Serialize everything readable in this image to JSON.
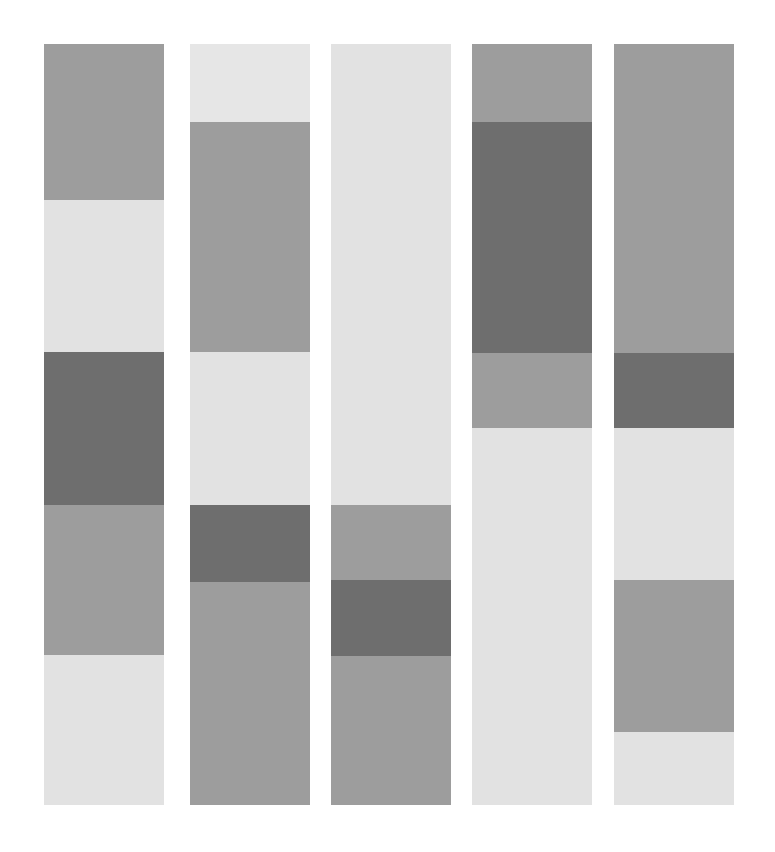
{
  "figure": {
    "title": "",
    "background_color": "#ffffff",
    "width": 775,
    "height": 852
  },
  "palette": {
    "very_light": "#e2e2e2",
    "light": "#dedede",
    "light_alt": "#e0e0e0",
    "medium_light": "#aaaaaa",
    "medium": "#9d9d9d",
    "medium_dark": "#969696",
    "dark": "#6e6e6e",
    "dark_alt": "#6a6a6a"
  },
  "chart_data": {
    "type": "bar",
    "title": "",
    "subtitle": "",
    "xlabel": "",
    "ylabel": "",
    "orientation": "vertical-stacked",
    "categories": [
      "Column 1",
      "Column 2",
      "Column 3",
      "Column 4",
      "Column 5"
    ],
    "grid": false,
    "legend": "none",
    "axis_labels_visible": false,
    "tick_labels_visible": false,
    "ylim": [
      44,
      805
    ],
    "columns": [
      {
        "name": "Column 1",
        "x": 44,
        "width": 120,
        "top": 44,
        "bottom": 805,
        "segments": [
          {
            "label": "c1-s1",
            "color": "#9d9d9d",
            "tone": "medium",
            "y_start": 44,
            "y_end": 200,
            "height": 156
          },
          {
            "label": "c1-s2",
            "color": "#e2e2e2",
            "tone": "very_light",
            "y_start": 200,
            "y_end": 352,
            "height": 152
          },
          {
            "label": "c1-s3",
            "color": "#6e6e6e",
            "tone": "dark",
            "y_start": 352,
            "y_end": 505,
            "height": 153
          },
          {
            "label": "c1-s4",
            "color": "#9d9d9d",
            "tone": "medium",
            "y_start": 505,
            "y_end": 655,
            "height": 150
          },
          {
            "label": "c1-s5",
            "color": "#e2e2e2",
            "tone": "very_light",
            "y_start": 655,
            "y_end": 805,
            "height": 150
          }
        ]
      },
      {
        "name": "Column 2",
        "x": 190,
        "width": 120,
        "top": 44,
        "bottom": 805,
        "segments": [
          {
            "label": "c2-s1",
            "color": "#e6e6e6",
            "tone": "very_light",
            "y_start": 44,
            "y_end": 122,
            "height": 78
          },
          {
            "label": "c2-s2",
            "color": "#9d9d9d",
            "tone": "medium",
            "y_start": 122,
            "y_end": 352,
            "height": 230
          },
          {
            "label": "c2-s3",
            "color": "#e2e2e2",
            "tone": "very_light",
            "y_start": 352,
            "y_end": 505,
            "height": 153
          },
          {
            "label": "c2-s4",
            "color": "#6e6e6e",
            "tone": "dark",
            "y_start": 505,
            "y_end": 582,
            "height": 77
          },
          {
            "label": "c2-s5",
            "color": "#9d9d9d",
            "tone": "medium",
            "y_start": 582,
            "y_end": 805,
            "height": 223
          }
        ]
      },
      {
        "name": "Column 3",
        "x": 331,
        "width": 120,
        "top": 44,
        "bottom": 805,
        "segments": [
          {
            "label": "c3-s1",
            "color": "#e2e2e2",
            "tone": "very_light",
            "y_start": 44,
            "y_end": 505,
            "height": 461
          },
          {
            "label": "c3-s2",
            "color": "#9d9d9d",
            "tone": "medium",
            "y_start": 505,
            "y_end": 580,
            "height": 75
          },
          {
            "label": "c3-s3",
            "color": "#6e6e6e",
            "tone": "dark",
            "y_start": 580,
            "y_end": 656,
            "height": 76
          },
          {
            "label": "c3-s4",
            "color": "#9d9d9d",
            "tone": "medium",
            "y_start": 656,
            "y_end": 805,
            "height": 149
          }
        ]
      },
      {
        "name": "Column 4",
        "x": 472,
        "width": 120,
        "top": 44,
        "bottom": 805,
        "segments": [
          {
            "label": "c4-s1",
            "color": "#9d9d9d",
            "tone": "medium",
            "y_start": 44,
            "y_end": 122,
            "height": 78
          },
          {
            "label": "c4-s2",
            "color": "#6e6e6e",
            "tone": "dark",
            "y_start": 122,
            "y_end": 353,
            "height": 231
          },
          {
            "label": "c4-s3",
            "color": "#9d9d9d",
            "tone": "medium",
            "y_start": 353,
            "y_end": 428,
            "height": 75
          },
          {
            "label": "c4-s4",
            "color": "#e2e2e2",
            "tone": "very_light",
            "y_start": 428,
            "y_end": 805,
            "height": 377
          }
        ]
      },
      {
        "name": "Column 5",
        "x": 614,
        "width": 120,
        "top": 44,
        "bottom": 805,
        "segments": [
          {
            "label": "c5-s1",
            "color": "#9d9d9d",
            "tone": "medium",
            "y_start": 44,
            "y_end": 353,
            "height": 309
          },
          {
            "label": "c5-s2",
            "color": "#6e6e6e",
            "tone": "dark",
            "y_start": 353,
            "y_end": 428,
            "height": 75
          },
          {
            "label": "c5-s3",
            "color": "#e2e2e2",
            "tone": "very_light",
            "y_start": 428,
            "y_end": 580,
            "height": 152
          },
          {
            "label": "c5-s4",
            "color": "#9d9d9d",
            "tone": "medium",
            "y_start": 580,
            "y_end": 732,
            "height": 152
          },
          {
            "label": "c5-s5",
            "color": "#e2e2e2",
            "tone": "very_light",
            "y_start": 732,
            "y_end": 805,
            "height": 73
          }
        ]
      }
    ]
  }
}
